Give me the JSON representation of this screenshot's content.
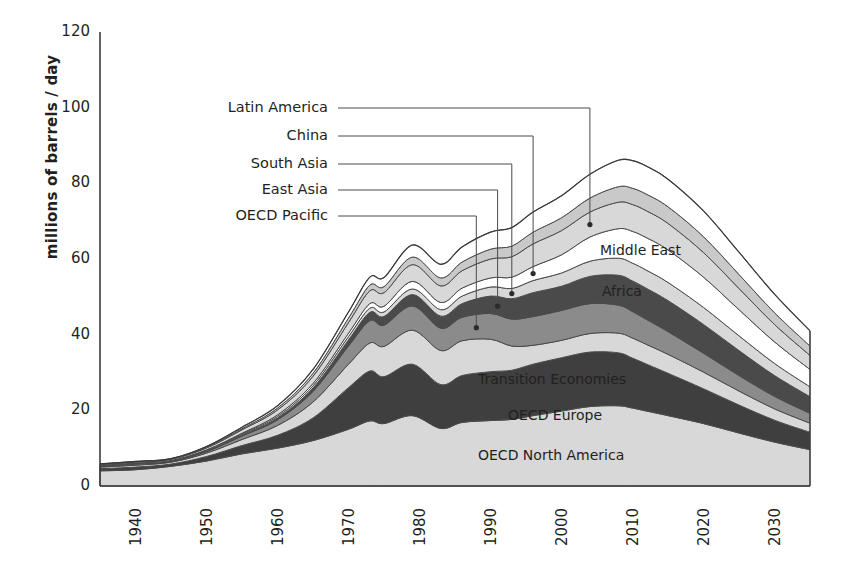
{
  "chart_data": {
    "type": "area",
    "stacked": true,
    "title": "",
    "xlabel": "",
    "ylabel": "millions of barrels / day",
    "xlim": [
      1935,
      2035
    ],
    "ylim": [
      0,
      120
    ],
    "ytick_labels": [
      "0",
      "20",
      "40",
      "60",
      "80",
      "100",
      "120"
    ],
    "ytick_values": [
      0,
      20,
      40,
      60,
      80,
      100,
      120
    ],
    "xtick_labels": [
      "1940",
      "1950",
      "1960",
      "1970",
      "1980",
      "1990",
      "2000",
      "2010",
      "2020",
      "2030"
    ],
    "xtick_values": [
      1940,
      1950,
      1960,
      1970,
      1980,
      1990,
      2000,
      2010,
      2020,
      2030
    ],
    "grid": false,
    "legend": "inline-callouts",
    "x": [
      1935,
      1940,
      1945,
      1950,
      1955,
      1960,
      1965,
      1970,
      1973,
      1975,
      1979,
      1983,
      1986,
      1990,
      1993,
      1996,
      2000,
      2004,
      2008,
      2010,
      2012,
      2015,
      2020,
      2025,
      2030,
      2035
    ],
    "series": [
      {
        "name": "OECD North America",
        "fill": "#d8d8d8",
        "values": [
          4.0,
          4.3,
          5.2,
          6.6,
          8.5,
          10.0,
          12.0,
          15.0,
          17.2,
          16.5,
          18.6,
          15.2,
          16.8,
          17.3,
          17.6,
          18.6,
          19.8,
          21.0,
          21.2,
          20.6,
          19.8,
          18.6,
          16.5,
          14.0,
          11.6,
          9.6
        ]
      },
      {
        "name": "OECD Europe",
        "fill": "#3f3f3f",
        "values": [
          0.6,
          0.7,
          0.6,
          1.2,
          2.2,
          3.4,
          6.0,
          11.0,
          13.2,
          12.4,
          13.6,
          11.6,
          12.4,
          12.9,
          13.0,
          13.6,
          14.1,
          14.4,
          14.0,
          13.2,
          12.4,
          11.2,
          9.2,
          7.4,
          5.8,
          4.6
        ]
      },
      {
        "name": "Transition Economies",
        "fill": "#d8d8d8",
        "values": [
          0.4,
          0.5,
          0.5,
          0.9,
          1.6,
          2.6,
          4.2,
          6.2,
          7.4,
          8.0,
          9.0,
          9.0,
          9.2,
          8.6,
          6.4,
          5.0,
          4.6,
          4.9,
          5.2,
          5.3,
          5.2,
          5.0,
          4.4,
          3.7,
          3.0,
          2.4
        ]
      },
      {
        "name": "OECD Pacific",
        "fill": "#8b8b8b",
        "values": [
          0.2,
          0.3,
          0.2,
          0.4,
          0.9,
          1.5,
          2.8,
          4.8,
          5.9,
          5.6,
          6.4,
          5.9,
          6.2,
          6.8,
          7.1,
          7.6,
          7.9,
          7.9,
          7.4,
          7.0,
          6.6,
          6.0,
          5.0,
          4.1,
          3.3,
          2.6
        ]
      },
      {
        "name": "East Asia",
        "fill": "#4a4a4a",
        "values": [
          0.1,
          0.1,
          0.1,
          0.2,
          0.3,
          0.5,
          0.9,
          1.6,
          2.2,
          2.3,
          3.0,
          3.2,
          3.6,
          4.6,
          5.4,
          6.3,
          6.4,
          7.2,
          7.9,
          8.1,
          8.2,
          8.2,
          7.6,
          6.6,
          5.5,
          4.4
        ]
      },
      {
        "name": "South Asia",
        "fill": "#d8d8d8",
        "values": [
          0.1,
          0.1,
          0.1,
          0.15,
          0.25,
          0.4,
          0.6,
          0.9,
          1.1,
          1.2,
          1.5,
          1.7,
          2.0,
          2.4,
          2.7,
          3.2,
          3.5,
          4.0,
          4.5,
          4.7,
          4.8,
          4.8,
          4.5,
          3.9,
          3.2,
          2.6
        ]
      },
      {
        "name": "China",
        "fill": "#ffffff",
        "values": [
          0.05,
          0.05,
          0.05,
          0.1,
          0.2,
          0.4,
          0.6,
          0.9,
          1.2,
          1.5,
          2.0,
          1.9,
          2.1,
          2.4,
          3.0,
          3.7,
          4.8,
          6.4,
          7.8,
          8.4,
          8.6,
          8.6,
          8.0,
          6.9,
          5.7,
          4.6
        ]
      },
      {
        "name": "Latin America",
        "fill": "#d8d8d8",
        "values": [
          0.2,
          0.25,
          0.3,
          0.5,
          0.9,
          1.3,
          1.9,
          2.8,
          3.4,
          3.6,
          4.4,
          4.4,
          4.6,
          5.0,
          5.4,
          6.0,
          6.4,
          6.6,
          7.0,
          7.1,
          7.1,
          7.0,
          6.5,
          5.6,
          4.6,
          3.7
        ]
      },
      {
        "name": "Africa",
        "fill": "#c9c9c9",
        "values": [
          0.1,
          0.1,
          0.1,
          0.2,
          0.3,
          0.5,
          0.8,
          1.2,
          1.5,
          1.6,
          2.0,
          2.1,
          2.3,
          2.6,
          2.8,
          3.1,
          3.4,
          3.7,
          4.1,
          4.3,
          4.4,
          4.4,
          4.2,
          3.7,
          3.1,
          2.5
        ]
      },
      {
        "name": "Middle East",
        "fill": "#ffffff",
        "values": [
          0.1,
          0.1,
          0.1,
          0.2,
          0.4,
          0.6,
          1.0,
          1.6,
          2.1,
          2.4,
          3.2,
          3.6,
          4.0,
          4.5,
          4.9,
          5.3,
          5.8,
          6.3,
          7.0,
          7.3,
          7.4,
          7.3,
          6.8,
          5.9,
          4.9,
          4.0
        ]
      }
    ],
    "callouts_left": [
      {
        "label": "Latin America",
        "target_year": 2004
      },
      {
        "label": "China",
        "target_year": 1996
      },
      {
        "label": "South Asia",
        "target_year": 1993
      },
      {
        "label": "East Asia",
        "target_year": 1991
      },
      {
        "label": "OECD Pacific",
        "target_year": 1988
      }
    ],
    "callouts_inline": [
      {
        "label": "Middle East"
      },
      {
        "label": "Africa"
      },
      {
        "label": "Transition Economies"
      },
      {
        "label": "OECD Europe"
      },
      {
        "label": "OECD North America"
      }
    ]
  }
}
